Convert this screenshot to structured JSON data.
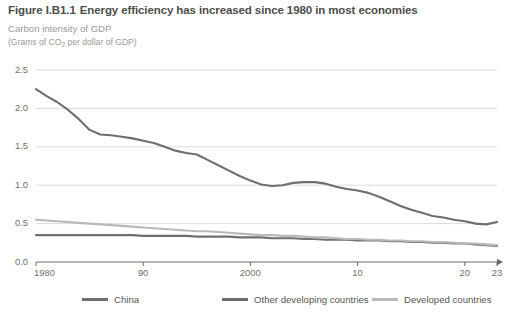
{
  "header": {
    "figure_number": "Figure I.B1.1",
    "title": "Energy efficiency has increased since 1980 in most economies",
    "subtitle": "Carbon intensity of GDP",
    "units_prefix": "(Grams of CO",
    "units_sub": "2",
    "units_suffix": " per dollar of GDP)"
  },
  "chart_data": {
    "type": "line",
    "title": "Energy efficiency has increased since 1980 in most economies",
    "subtitle": "Carbon intensity of GDP",
    "xlabel": "",
    "ylabel": "Grams of CO2 per dollar of GDP",
    "xlim": [
      1980,
      2023
    ],
    "ylim": [
      0.0,
      2.5
    ],
    "grid": true,
    "legend_position": "bottom",
    "y_ticks": [
      0.0,
      0.5,
      1.0,
      1.5,
      2.0,
      2.5
    ],
    "y_tick_labels": [
      "0.0",
      "0.5",
      "1.0",
      "1.5",
      "2.0",
      "2.5"
    ],
    "x_ticks": [
      1980,
      1990,
      2000,
      2010,
      2020,
      2023
    ],
    "x_tick_labels": [
      "1980",
      "90",
      "2000",
      "10",
      "20",
      "23"
    ],
    "x": [
      1980,
      1981,
      1982,
      1983,
      1984,
      1985,
      1986,
      1987,
      1988,
      1989,
      1990,
      1991,
      1992,
      1993,
      1994,
      1995,
      1996,
      1997,
      1998,
      1999,
      2000,
      2001,
      2002,
      2003,
      2004,
      2005,
      2006,
      2007,
      2008,
      2009,
      2010,
      2011,
      2012,
      2013,
      2014,
      2015,
      2016,
      2017,
      2018,
      2019,
      2020,
      2021,
      2022,
      2023
    ],
    "series": [
      {
        "name": "China",
        "color": "#6e6e6e",
        "values": [
          2.25,
          2.16,
          2.08,
          1.98,
          1.86,
          1.72,
          1.66,
          1.65,
          1.63,
          1.61,
          1.58,
          1.55,
          1.5,
          1.45,
          1.42,
          1.4,
          1.33,
          1.26,
          1.19,
          1.12,
          1.06,
          1.01,
          0.99,
          1.0,
          1.03,
          1.04,
          1.04,
          1.02,
          0.98,
          0.95,
          0.93,
          0.9,
          0.85,
          0.79,
          0.73,
          0.68,
          0.64,
          0.6,
          0.58,
          0.55,
          0.53,
          0.5,
          0.49,
          0.52
        ]
      },
      {
        "name": "Other developing countries",
        "color": "#6f6f6f",
        "values": [
          0.35,
          0.35,
          0.35,
          0.35,
          0.35,
          0.35,
          0.35,
          0.35,
          0.35,
          0.35,
          0.34,
          0.34,
          0.34,
          0.34,
          0.34,
          0.33,
          0.33,
          0.33,
          0.33,
          0.32,
          0.32,
          0.32,
          0.31,
          0.31,
          0.31,
          0.3,
          0.3,
          0.29,
          0.29,
          0.29,
          0.28,
          0.28,
          0.28,
          0.27,
          0.27,
          0.26,
          0.26,
          0.25,
          0.25,
          0.24,
          0.24,
          0.23,
          0.22,
          0.21
        ]
      },
      {
        "name": "Developed countries",
        "color": "#b9b9b9",
        "values": [
          0.55,
          0.54,
          0.53,
          0.52,
          0.51,
          0.5,
          0.49,
          0.48,
          0.47,
          0.46,
          0.45,
          0.44,
          0.43,
          0.42,
          0.41,
          0.4,
          0.4,
          0.39,
          0.38,
          0.37,
          0.36,
          0.35,
          0.35,
          0.34,
          0.34,
          0.33,
          0.32,
          0.32,
          0.31,
          0.3,
          0.3,
          0.29,
          0.29,
          0.28,
          0.28,
          0.27,
          0.27,
          0.26,
          0.26,
          0.25,
          0.24,
          0.24,
          0.23,
          0.22
        ]
      }
    ]
  },
  "legend": [
    {
      "label": "China",
      "color": "#6e6e6e"
    },
    {
      "label": "Other developing countries",
      "color": "#6f6f6f"
    },
    {
      "label": "Developed countries",
      "color": "#b9b9b9"
    }
  ]
}
